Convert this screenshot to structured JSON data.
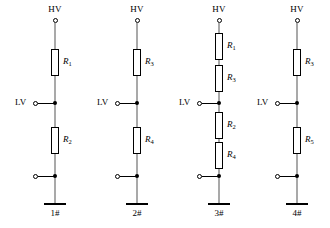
{
  "figure": {
    "background_color": "#ffffff",
    "line_color": "#000000",
    "wire_color": "#555555"
  },
  "circuits": [
    {
      "name": "1#",
      "hv_label": "HV",
      "lv_label": "LV",
      "hv_terminal": "open-circle-terminal",
      "lv_terminal": "open-circle-terminal",
      "bottom_terminal": "open-circle-terminal",
      "ground": "ground-symbol",
      "resistors_above_tap": [
        {
          "label": "R",
          "subscript": "1"
        }
      ],
      "resistors_below_tap": [
        {
          "label": "R",
          "subscript": "2"
        }
      ]
    },
    {
      "name": "2#",
      "hv_label": "HV",
      "lv_label": "LV",
      "hv_terminal": "open-circle-terminal",
      "lv_terminal": "open-circle-terminal",
      "bottom_terminal": "open-circle-terminal",
      "ground": "ground-symbol",
      "resistors_above_tap": [
        {
          "label": "R",
          "subscript": "3"
        }
      ],
      "resistors_below_tap": [
        {
          "label": "R",
          "subscript": "4"
        }
      ]
    },
    {
      "name": "3#",
      "hv_label": "HV",
      "lv_label": "LV",
      "hv_terminal": "open-circle-terminal",
      "lv_terminal": "open-circle-terminal",
      "bottom_terminal": "open-circle-terminal",
      "ground": "ground-symbol",
      "resistors_above_tap": [
        {
          "label": "R",
          "subscript": "1"
        },
        {
          "label": "R",
          "subscript": "3"
        }
      ],
      "resistors_below_tap": [
        {
          "label": "R",
          "subscript": "2"
        },
        {
          "label": "R",
          "subscript": "4"
        }
      ]
    },
    {
      "name": "4#",
      "hv_label": "HV",
      "lv_label": "LV",
      "hv_terminal": "open-circle-terminal",
      "lv_terminal": "open-circle-terminal",
      "bottom_terminal": "open-circle-terminal",
      "ground": "ground-symbol",
      "resistors_above_tap": [
        {
          "label": "R",
          "subscript": "3"
        }
      ],
      "resistors_below_tap": [
        {
          "label": "R",
          "subscript": "5"
        }
      ]
    }
  ]
}
